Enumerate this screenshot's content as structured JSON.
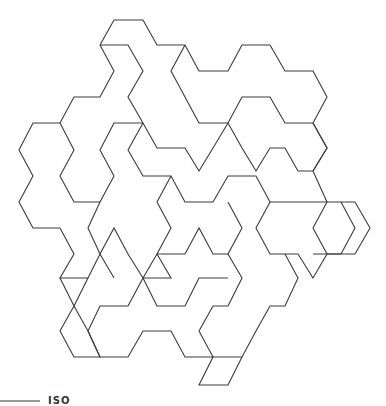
{
  "figure": {
    "stroke_color": "#3a3a3a",
    "background": "#ffffff",
    "polylines": [
      "100,45 114,20 143,20 157,45 185,45 199,71 228,71 242,45 270,45 285,71 313,71 327,97 313,123 285,123 270,97 242,97 228,123 199,123 185,97 171,71 185,45",
      "100,45 128,45 143,71 128,97 143,123 157,148 185,148 199,171 213,148 228,123 242,148 256,171 270,148 285,148 298,171 313,171 327,148 313,123",
      "100,45 114,71 100,97 74,97 60,123 33,123 19,150 33,176 19,202 33,228 60,228 74,254 60,278 88,278 100,254 88,228 100,202 114,176 100,150 114,123 143,123",
      "60,123 74,150 60,176 74,202 100,202",
      "143,123 128,150 143,176 171,176 185,202 213,202 228,176 256,176 270,202 298,202",
      "313,171 327,202 313,228 327,254 313,278 298,254 270,254 256,228 270,202",
      "313,123 327,148 313,171",
      "298,202 341,202 355,228 341,254 313,254",
      "341,202 355,202 370,228 355,254 327,254",
      "228,202 242,228 228,254 242,278 228,306 213,306 199,331 213,357 242,357 256,331 270,306 285,306 298,278 285,254",
      "171,176 157,202 171,228 157,254 171,278 143,278 128,254 114,228 100,254 114,278",
      "88,278 74,306 88,331 100,357 128,357 143,331 171,331 185,357 213,357 199,385 228,385 242,357",
      "100,357 88,331 100,306 128,306 143,278 157,306 185,306 199,278 228,278",
      "60,278 74,306 60,331 74,357 100,357",
      "143,278 157,254 185,254 199,228 213,254 228,254"
    ]
  },
  "caption": {
    "text": "ISO"
  }
}
